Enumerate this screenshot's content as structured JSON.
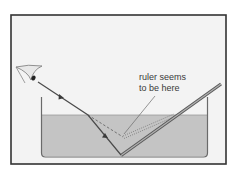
{
  "diagram": {
    "label_line1": "ruler seems",
    "label_line2": "to be here",
    "colors": {
      "frame_border": "#333333",
      "background": "#f3f3f3",
      "water": "#c4c4c4",
      "tank_wall": "#6a6a6a",
      "ray": "#4a4a4a",
      "ruler": "#7a7a7a",
      "text": "#3a3a3a"
    },
    "elements": {
      "eye": "observer-eye",
      "tank": "water-tank",
      "ruler": "ruler-rod",
      "real_ray": "light-ray-refracted",
      "virtual_ray": "dashed-apparent-ray",
      "apparent_ruler": "dotted-apparent-ruler",
      "pointer": "label-pointer-line"
    }
  }
}
